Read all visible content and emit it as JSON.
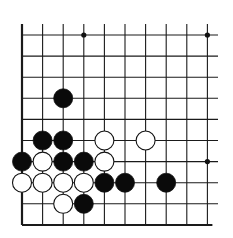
{
  "board": {
    "title": "Go board diagram (lower-left corner)",
    "cols_x": [
      22,
      42.6,
      63.2,
      83.8,
      104.4,
      125,
      145.6,
      166.2,
      186.8,
      207.4
    ],
    "rows_y": [
      35,
      56.1,
      77.2,
      98.3,
      119.4,
      140.5,
      161.6,
      182.7,
      203.8,
      225
    ],
    "right_extent": 218,
    "top_extent": 24,
    "line_color": "#1a1a1a",
    "stone_radius": 9.5,
    "star_points": [
      [
        3,
        0
      ],
      [
        9,
        0
      ],
      [
        9,
        6
      ]
    ],
    "stones": [
      {
        "color": "black",
        "col": 2,
        "row": 3
      },
      {
        "color": "black",
        "col": 1,
        "row": 5
      },
      {
        "color": "black",
        "col": 2,
        "row": 5
      },
      {
        "color": "white",
        "col": 4,
        "row": 5
      },
      {
        "color": "white",
        "col": 6,
        "row": 5
      },
      {
        "color": "black",
        "col": 0,
        "row": 6
      },
      {
        "color": "white",
        "col": 1,
        "row": 6
      },
      {
        "color": "black",
        "col": 2,
        "row": 6
      },
      {
        "color": "black",
        "col": 3,
        "row": 6
      },
      {
        "color": "white",
        "col": 4,
        "row": 6
      },
      {
        "color": "white",
        "col": 0,
        "row": 7
      },
      {
        "color": "white",
        "col": 1,
        "row": 7
      },
      {
        "color": "white",
        "col": 2,
        "row": 7
      },
      {
        "color": "white",
        "col": 3,
        "row": 7
      },
      {
        "color": "black",
        "col": 4,
        "row": 7
      },
      {
        "color": "black",
        "col": 5,
        "row": 7
      },
      {
        "color": "black",
        "col": 7,
        "row": 7
      },
      {
        "color": "white",
        "col": 2,
        "row": 8
      },
      {
        "color": "black",
        "col": 3,
        "row": 8
      }
    ]
  }
}
